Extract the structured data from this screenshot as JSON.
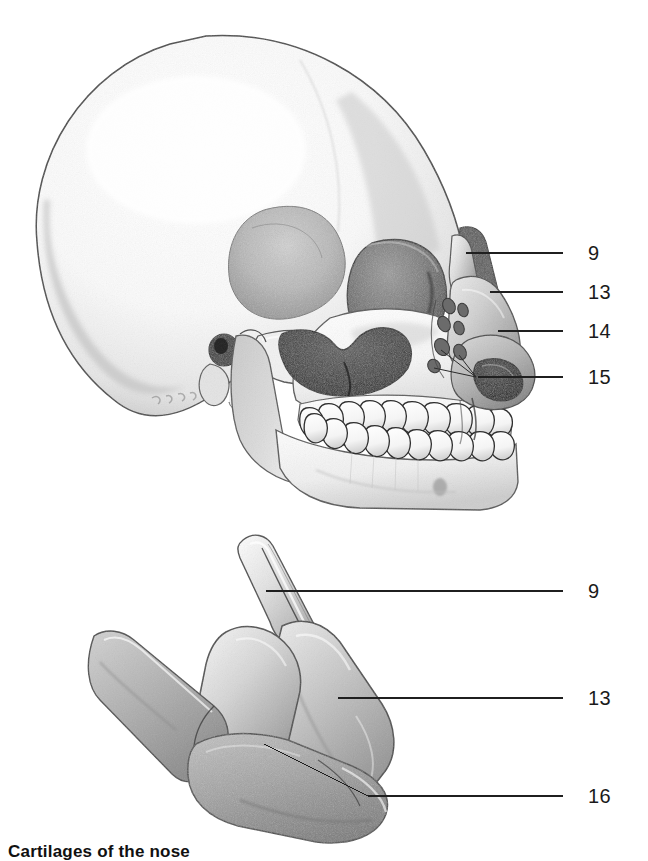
{
  "page": {
    "width": 648,
    "height": 861,
    "background": "#ffffff",
    "ink": "#1a1a1a"
  },
  "figures": [
    {
      "id": "skull-lateral",
      "name": "skull-lateral-view",
      "description": "Pencil-shaded lateral view of a human skull showing cranium, orbit, zygomatic arch, nasal aperture, maxilla, mandible with full dentition, and the nasal cartilages attached at the nose.",
      "signature_present": true
    },
    {
      "id": "nasal-cartilage-complex",
      "name": "isolated-nasal-cartilage-complex",
      "description": "Pencil-shaded isolated nasal cartilage complex: septal cartilage with posterior process, lateral nasal cartilage, and major alar cartilage."
    }
  ],
  "callouts": {
    "skull": [
      {
        "label": "9",
        "name": "callout-9-skull",
        "leader": {
          "x1": 466,
          "y1": 253,
          "x2": 563,
          "y2": 253
        },
        "label_x": 588,
        "label_y": 243
      },
      {
        "label": "13",
        "name": "callout-13-skull",
        "leader": {
          "x1": 490,
          "y1": 292,
          "x2": 563,
          "y2": 292
        },
        "label_x": 588,
        "label_y": 282
      },
      {
        "label": "14",
        "name": "callout-14-skull",
        "leader": {
          "x1": 498,
          "y1": 331,
          "x2": 563,
          "y2": 331
        },
        "label_x": 588,
        "label_y": 321
      },
      {
        "label": "15",
        "name": "callout-15-skull",
        "leader": {
          "x1": 478,
          "y1": 377,
          "x2": 563,
          "y2": 377
        },
        "label_x": 588,
        "label_y": 367
      }
    ],
    "cartilage": [
      {
        "label": "9",
        "name": "callout-9-cartilage",
        "leader": {
          "x1": 266,
          "y1": 591,
          "x2": 563,
          "y2": 591
        },
        "label_x": 588,
        "label_y": 581
      },
      {
        "label": "13",
        "name": "callout-13-cartilage",
        "leader": {
          "x1": 338,
          "y1": 698,
          "x2": 563,
          "y2": 698
        },
        "label_x": 588,
        "label_y": 688
      },
      {
        "label": "16",
        "name": "callout-16-cartilage",
        "leader": {
          "x1": 264,
          "y1": 744,
          "x2": 563,
          "y2": 796
        },
        "label_x": 588,
        "label_y": 786
      }
    ]
  },
  "caption": {
    "text": "Cartilages of the nose",
    "visible_fragment": "Cartilages of the nose"
  }
}
